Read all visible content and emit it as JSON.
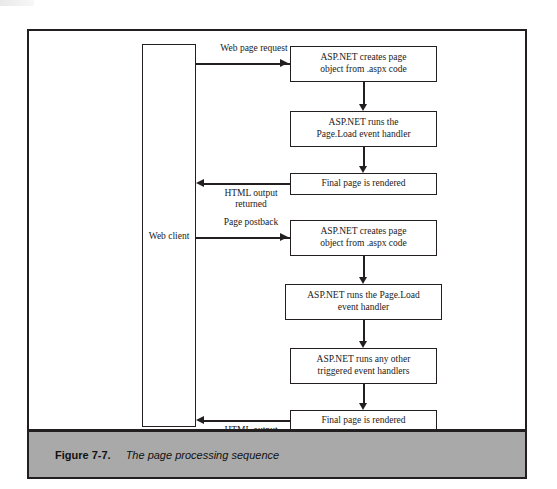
{
  "figure": {
    "caption_number": "Figure 7-7.",
    "caption_text": "The page processing sequence",
    "band_color": "#a9a9a9",
    "line_color": "#231f20"
  },
  "diagram": {
    "type": "flowchart",
    "lane": {
      "label": "Web client"
    },
    "boxes": [
      {
        "id": "box1",
        "label": "ASP.NET creates page\nobject from .aspx code"
      },
      {
        "id": "box2",
        "label": "ASP.NET runs the\nPage.Load event handler"
      },
      {
        "id": "box3",
        "label": "Final page is rendered"
      },
      {
        "id": "box4",
        "label": "ASP.NET creates page\nobject from .aspx code"
      },
      {
        "id": "box5",
        "label": "ASP.NET runs the Page.Load\nevent handler"
      },
      {
        "id": "box6",
        "label": "ASP.NET runs any other\ntriggered event handlers"
      },
      {
        "id": "box7",
        "label": "Final page is rendered"
      }
    ],
    "edges": [
      {
        "id": "edge1",
        "label": "Web page request",
        "direction": "right"
      },
      {
        "id": "edge2",
        "label": "HTML output\nreturned",
        "direction": "left"
      },
      {
        "id": "edge3",
        "label": "Page postback",
        "direction": "right"
      },
      {
        "id": "edge4",
        "label": "HTML output\nreturned",
        "direction": "left"
      }
    ]
  }
}
